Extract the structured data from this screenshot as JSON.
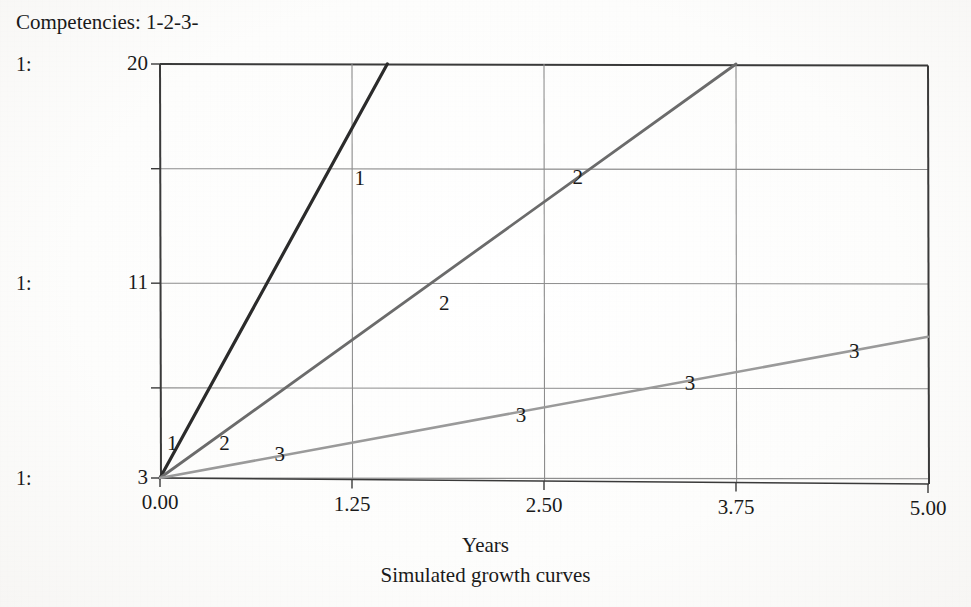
{
  "header": {
    "title": "Competencies: 1-2-3-"
  },
  "chart_data": {
    "type": "line",
    "title": "Competencies: 1-2-3-",
    "caption": "Simulated growth curves",
    "xlabel": "Years",
    "ylabel": "",
    "xlim": [
      0.0,
      5.0
    ],
    "ylim": [
      3,
      20
    ],
    "grid": true,
    "legend": "inline-series-labels",
    "x_ticks": [
      "0.00",
      "1.25",
      "2.50",
      "3.75",
      "5.00"
    ],
    "x_tick_values": [
      0.0,
      1.25,
      2.5,
      3.75,
      5.0
    ],
    "y_ticks": [
      "20",
      "11",
      "3"
    ],
    "y_tick_values": [
      20,
      11,
      3
    ],
    "y_gridline_values": [
      20,
      15.7,
      11,
      6.7,
      3
    ],
    "scale_markers": [
      "1:",
      "1:",
      "1:"
    ],
    "series": [
      {
        "name": "1",
        "color": "#2b2b2b",
        "width": 3.2,
        "x": [
          0.0,
          1.48
        ],
        "values": [
          3,
          20
        ],
        "labels": [
          {
            "text": "1",
            "x": 0.08,
            "y": 4.45
          },
          {
            "text": "1",
            "x": 1.3,
            "y": 15.3
          }
        ]
      },
      {
        "name": "2",
        "color": "#6b6b6b",
        "width": 2.8,
        "x": [
          0.0,
          3.75
        ],
        "values": [
          3,
          20
        ],
        "labels": [
          {
            "text": "2",
            "x": 0.42,
            "y": 4.45
          },
          {
            "text": "2",
            "x": 1.85,
            "y": 10.2
          },
          {
            "text": "2",
            "x": 2.72,
            "y": 15.35
          }
        ]
      },
      {
        "name": "3",
        "color": "#9a9a9a",
        "width": 2.6,
        "x": [
          0.0,
          5.0
        ],
        "values": [
          3,
          8.8
        ],
        "labels": [
          {
            "text": "3",
            "x": 0.78,
            "y": 4.0
          },
          {
            "text": "3",
            "x": 2.35,
            "y": 5.6
          },
          {
            "text": "3",
            "x": 3.45,
            "y": 6.9
          },
          {
            "text": "3",
            "x": 4.52,
            "y": 8.2
          }
        ]
      }
    ],
    "colors": {
      "series_1": "#2b2b2b",
      "series_2": "#6b6b6b",
      "series_3": "#9a9a9a",
      "grid": "#8d8d8d",
      "axis": "#3a3a3a",
      "text": "#1a1a1a",
      "background": "#ffffff"
    }
  },
  "axis_titles": {
    "x": "Years"
  },
  "caption": {
    "text": "Simulated growth curves"
  },
  "scan_artifacts": {
    "bleed_1": "  ",
    "bleed_2": "  ",
    "bleed_3": "  "
  }
}
